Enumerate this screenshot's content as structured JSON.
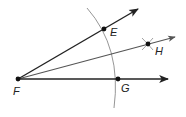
{
  "diagram": {
    "colors": {
      "ray": "#222222",
      "bisector": "#555555",
      "arc": "#8a8a8a",
      "point": "#111111",
      "label": "#222222"
    },
    "points": {
      "F": {
        "label": "F",
        "x": 18,
        "y": 79
      },
      "E": {
        "label": "E",
        "x": 104,
        "y": 29
      },
      "H": {
        "label": "H",
        "x": 148,
        "y": 44
      },
      "G": {
        "label": "G",
        "x": 118,
        "y": 79
      }
    },
    "rays": [
      {
        "name": "ray-FE",
        "from": "F",
        "through": "E"
      },
      {
        "name": "ray-FH",
        "from": "F",
        "through": "H"
      },
      {
        "name": "ray-FG",
        "from": "F",
        "through": "G"
      }
    ],
    "arcs": [
      {
        "name": "compass-arc",
        "center": "F",
        "through": [
          "E",
          "G"
        ]
      }
    ],
    "marks": [
      {
        "name": "intersecting-arc-marks",
        "at": "H"
      }
    ]
  }
}
